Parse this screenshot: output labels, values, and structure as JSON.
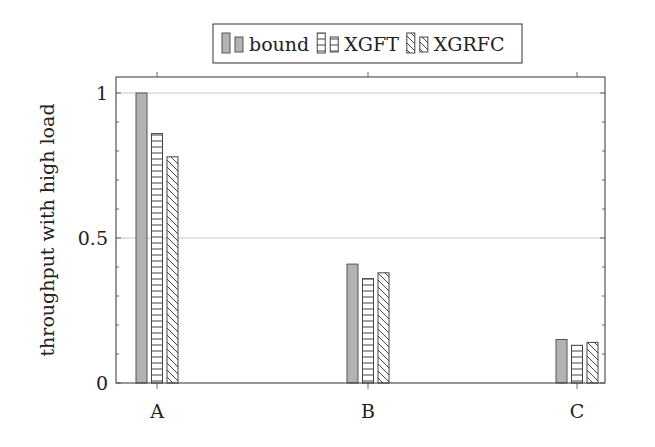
{
  "chart_data": {
    "type": "bar",
    "title": "",
    "xlabel": "",
    "ylabel": "throughput with high load",
    "categories": [
      "A",
      "B",
      "C"
    ],
    "series": [
      {
        "name": "bound",
        "values": [
          1.0,
          0.41,
          0.15
        ],
        "pattern": "solid",
        "fill": "#b3b3b3",
        "stroke": "#555555"
      },
      {
        "name": "XGFT",
        "values": [
          0.86,
          0.36,
          0.13
        ],
        "pattern": "horizontal-lines",
        "fill": "#ffffff",
        "stroke": "#444444"
      },
      {
        "name": "XGRFC",
        "values": [
          0.78,
          0.38,
          0.14
        ],
        "pattern": "north-west-lines",
        "fill": "#ffffff",
        "stroke": "#444444"
      }
    ],
    "ylim": [
      0,
      1.05
    ],
    "yticks": [
      0,
      0.5,
      1
    ],
    "ytick_labels": [
      "0",
      "0.5",
      "1"
    ],
    "minor_yticks": true,
    "grid": "major-y",
    "legend_position": "top-center",
    "legend_columns": 3
  }
}
